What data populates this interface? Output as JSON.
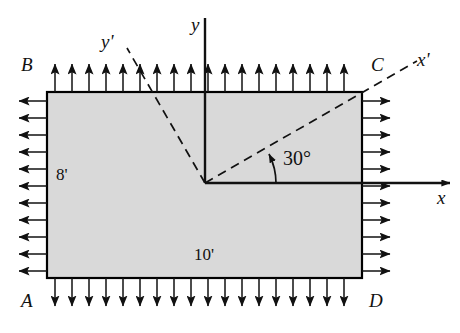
{
  "figure": {
    "type": "engineering-stress-element-diagram",
    "plate": {
      "fill_color": "#d9d9d9",
      "stroke_color": "#000000",
      "corner_labels": {
        "top_left": "B",
        "top_right": "C",
        "bottom_left": "A",
        "bottom_right": "D"
      },
      "dimensions": {
        "height_label": "8'",
        "width_label": "10'"
      }
    },
    "axes": {
      "x_label": "x",
      "y_label": "y",
      "x_prime_label": "x'",
      "y_prime_label": "y'",
      "axis_color": "#000000",
      "prime_axis_style": "dashed"
    },
    "angle": {
      "value_label": "30°",
      "degrees": 30
    },
    "loading": {
      "top_arrow_direction": "up",
      "bottom_arrow_direction": "down",
      "left_arrow_direction": "left",
      "right_arrow_direction": "right",
      "top_arrow_count": 18,
      "bottom_arrow_count": 18,
      "left_arrow_count": 11,
      "right_arrow_count": 11
    }
  }
}
